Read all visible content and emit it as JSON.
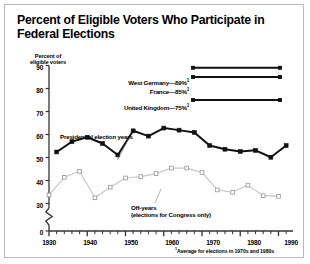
{
  "title": "Percent of Eligible Voters Who Participate in Federal Elections",
  "footnote": "Average for elections in 1970s and 1980s",
  "axis": {
    "ylabel_line1": "Percent of",
    "ylabel_line2": "eligible voters",
    "yticks": [
      "90",
      "80",
      "70",
      "60",
      "50",
      "40",
      "30",
      "0"
    ],
    "xticks": [
      "1930",
      "1940",
      "1950",
      "1960",
      "1970",
      "1980",
      "1990"
    ]
  },
  "legend": [
    {
      "label": "West Germany—89%",
      "note": "1",
      "value": 89
    },
    {
      "label": "France—85%",
      "note": "1",
      "value": 85
    },
    {
      "label": "United Kingdom—75%",
      "note": "1",
      "value": 75
    }
  ],
  "annotations": {
    "presidential": "Presidential election years",
    "offyears_line1": "Off-years",
    "offyears_line2": "(elections for Congress only)"
  },
  "colors": {
    "presidential_line": "#111111",
    "offyear_line": "#c6c6c6",
    "offyear_marker_edge": "#9a9a9a",
    "axis": "#333333",
    "frame": "#b9b9b9"
  },
  "chart_data": {
    "type": "line",
    "title": "Percent of Eligible Voters Who Participate in Federal Elections",
    "xlabel": "",
    "ylabel": "Percent of eligible voters",
    "xlim": [
      1928,
      1994
    ],
    "ylim": [
      26,
      90
    ],
    "yticks": [
      30,
      40,
      50,
      60,
      70,
      80,
      90
    ],
    "xticks": [
      1930,
      1940,
      1950,
      1960,
      1970,
      1980,
      1990
    ],
    "grid": false,
    "axis_break_below": 30,
    "legend_position": "inside-top-right",
    "series": [
      {
        "name": "Presidential election years",
        "marker": "filled-square",
        "color": "#111111",
        "x": [
          1932,
          1936,
          1940,
          1944,
          1948,
          1952,
          1956,
          1960,
          1964,
          1968,
          1972,
          1976,
          1980,
          1984,
          1988,
          1992
        ],
        "values": [
          52.4,
          56.9,
          58.8,
          56.1,
          51.1,
          61.6,
          59.3,
          62.8,
          61.9,
          60.9,
          55.2,
          53.6,
          52.6,
          53.1,
          50.1,
          55.2
        ]
      },
      {
        "name": "Off-years (elections for Congress only)",
        "marker": "open-square",
        "color": "#c6c6c6",
        "x": [
          1930,
          1934,
          1938,
          1942,
          1946,
          1950,
          1954,
          1958,
          1962,
          1966,
          1970,
          1974,
          1978,
          1982,
          1986,
          1990
        ],
        "values": [
          33.7,
          41.4,
          44.0,
          32.5,
          37.1,
          41.1,
          41.7,
          43.0,
          45.4,
          45.4,
          43.5,
          35.9,
          34.9,
          38.0,
          33.4,
          33.1
        ]
      },
      {
        "name": "West Germany",
        "marker": "filled-square",
        "color": "#111111",
        "reference_line": true,
        "values": [
          89,
          89
        ]
      },
      {
        "name": "France",
        "marker": "filled-square",
        "color": "#111111",
        "reference_line": true,
        "values": [
          85,
          85
        ]
      },
      {
        "name": "United Kingdom",
        "marker": "filled-square",
        "color": "#111111",
        "reference_line": true,
        "values": [
          75,
          75
        ]
      }
    ],
    "annotations": [
      {
        "text": "Presidential election years",
        "points_to_year": 1952
      },
      {
        "text": "Off-years (elections for Congress only)",
        "points_to_year": 1982
      }
    ]
  }
}
